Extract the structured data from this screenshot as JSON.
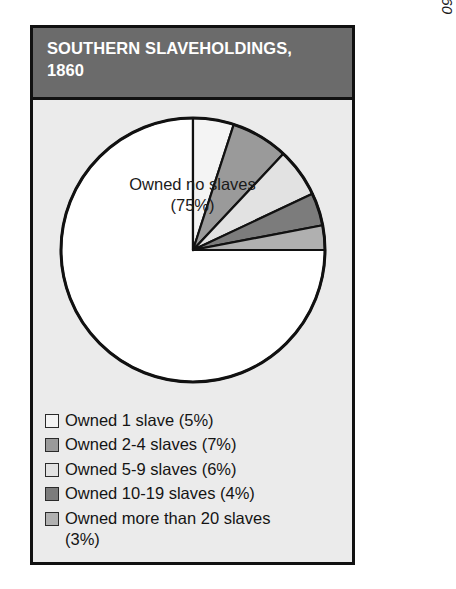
{
  "header": {
    "title": "SOUTHERN SLAVEHOLDINGS,\n1860"
  },
  "source": {
    "prefix": "Source: ",
    "title": "Compendium of the Eighth Census, 1860"
  },
  "center_label": "Owned no slaves\n(75%)",
  "legend": {
    "items": [
      {
        "label": "Owned 1 slave (5%)",
        "swatch": "#f4f4f4"
      },
      {
        "label": "Owned 2-4 slaves (7%)",
        "swatch": "#9a9a9a"
      },
      {
        "label": "Owned 5-9 slaves (6%)",
        "swatch": "#e2e2e2"
      },
      {
        "label": "Owned 10-19 slaves (4%)",
        "swatch": "#7c7c7c"
      },
      {
        "label": "Owned more than 20 slaves\n     (3%)",
        "swatch": "#b0b0b0"
      }
    ]
  },
  "colors": {
    "frame_bg": "#ebebeb",
    "header_bg": "#6b6b6b",
    "outline": "#111111",
    "page_bg": "#ffffff"
  },
  "chart_data": {
    "type": "pie",
    "title": "SOUTHERN SLAVEHOLDINGS, 1860",
    "subtitle": "",
    "xlabel": "",
    "ylabel": "",
    "units": "percent",
    "start_angle_deg": 0,
    "direction": "clockwise",
    "legend_position": "bottom",
    "grid": false,
    "categories": [
      "Owned no slaves",
      "Owned 1 slave",
      "Owned 2-4 slaves",
      "Owned 5-9 slaves",
      "Owned 10-19 slaves",
      "Owned more than 20 slaves"
    ],
    "values": [
      75,
      5,
      7,
      6,
      4,
      3
    ],
    "slice_colors": [
      "#ffffff",
      "#f4f4f4",
      "#9a9a9a",
      "#e2e2e2",
      "#7c7c7c",
      "#b0b0b0"
    ],
    "annotations": [
      "Owned no slaves (75%)"
    ],
    "source": "Source: Compendium of the Eighth Census, 1860"
  }
}
